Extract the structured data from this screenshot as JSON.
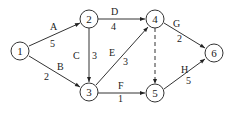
{
  "diagram": {
    "type": "activity-on-arrow network",
    "nodes": [
      {
        "id": "1",
        "label": "1"
      },
      {
        "id": "2",
        "label": "2"
      },
      {
        "id": "3",
        "label": "3"
      },
      {
        "id": "4",
        "label": "4"
      },
      {
        "id": "5",
        "label": "5"
      },
      {
        "id": "6",
        "label": "6"
      }
    ],
    "edges": [
      {
        "from": "1",
        "to": "2",
        "activity": "A",
        "duration": "5"
      },
      {
        "from": "1",
        "to": "3",
        "activity": "B",
        "duration": "2"
      },
      {
        "from": "2",
        "to": "3",
        "activity": "C",
        "duration": "3"
      },
      {
        "from": "2",
        "to": "4",
        "activity": "D",
        "duration": "4"
      },
      {
        "from": "3",
        "to": "4",
        "activity": "E",
        "duration": "3"
      },
      {
        "from": "3",
        "to": "5",
        "activity": "F",
        "duration": "1"
      },
      {
        "from": "4",
        "to": "6",
        "activity": "G",
        "duration": "2"
      },
      {
        "from": "4",
        "to": "5",
        "activity": "",
        "duration": "",
        "dummy": true
      },
      {
        "from": "5",
        "to": "6",
        "activity": "H",
        "duration": "5"
      }
    ]
  }
}
